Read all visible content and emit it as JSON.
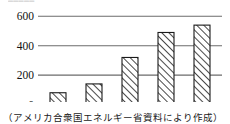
{
  "figure": {
    "top_remnant_text": "▬▬▬▬▬",
    "caption": "（アメリカ合衆国エネルギー省資料により作成）",
    "x_unit_label": "（年）"
  },
  "chart_data": {
    "type": "bar",
    "title": "",
    "subtitle": "",
    "xlabel": "（年）",
    "ylabel": "",
    "categories": [
      "2000",
      "2005",
      "2010",
      "2015",
      "2019"
    ],
    "values": [
      80,
      140,
      320,
      490,
      540
    ],
    "ylim": [
      0,
      620
    ],
    "yticks": [
      0,
      200,
      400,
      600
    ],
    "ytick_labels": [
      "0",
      "200",
      "400",
      "600"
    ],
    "xtick_labels": [
      "2000",
      "2005",
      "2010",
      "2015",
      "2019"
    ],
    "grid": true,
    "grid_axis": "y",
    "legend": false,
    "legend_position": "none",
    "bar_fill": "hatch-diagonal",
    "bar_edge_color": "#1a1a1a",
    "axis_color": "#1a1a1a",
    "grid_color": "#6b6b6b",
    "annotations": [
      "（アメリカ合衆国エネルギー省資料により作成）"
    ]
  }
}
